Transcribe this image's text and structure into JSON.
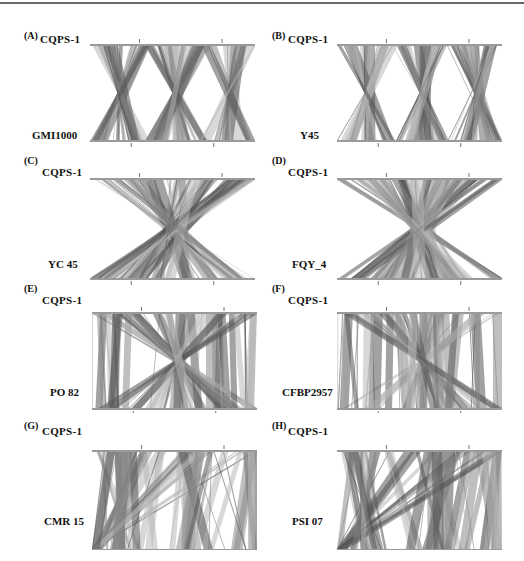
{
  "figure": {
    "panels": [
      {
        "id": "A",
        "letter": "(A)",
        "reference": "CQPS-1",
        "query": "GMI1000",
        "style": "cross"
      },
      {
        "id": "B",
        "letter": "(B)",
        "reference": "CQPS-1",
        "query": "Y45",
        "style": "cross"
      },
      {
        "id": "C",
        "letter": "(C)",
        "reference": "CQPS-1",
        "query": "YC 45",
        "style": "inverted"
      },
      {
        "id": "D",
        "letter": "(D)",
        "reference": "CQPS-1",
        "query": "FQY_4",
        "style": "inverted"
      },
      {
        "id": "E",
        "letter": "(E)",
        "reference": "CQPS-1",
        "query": "PO 82",
        "style": "mixed"
      },
      {
        "id": "F",
        "letter": "(F)",
        "reference": "CQPS-1",
        "query": "CFBP2957",
        "style": "mixed"
      },
      {
        "id": "G",
        "letter": "(G)",
        "reference": "CQPS-1",
        "query": "CMR 15",
        "style": "blocks"
      },
      {
        "id": "H",
        "letter": "(H)",
        "reference": "CQPS-1",
        "query": "PSI 07",
        "style": "blocks"
      }
    ]
  },
  "colors": {
    "link_dark": "#555555",
    "link_mid": "#8a8a8a",
    "link_light": "#b8b8b8",
    "axis": "#9a9a9a",
    "text": "#111111"
  }
}
